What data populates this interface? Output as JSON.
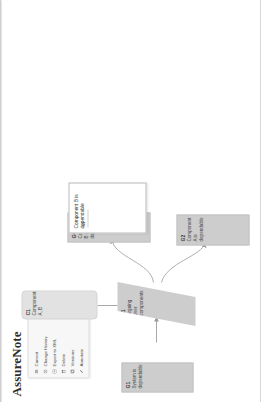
{
  "app": {
    "title": "AssureNote"
  },
  "context_menu": {
    "items": [
      {
        "label": "Current",
        "icon": "list-icon"
      },
      {
        "label": "Change History",
        "icon": "clock-icon"
      },
      {
        "label": "Export to XML",
        "icon": "export-icon"
      },
      {
        "label": "Delete",
        "icon": "trash-icon"
      },
      {
        "label": "Versions",
        "icon": "layers-icon"
      },
      {
        "label": "Annotate",
        "icon": "pencil-icon"
      }
    ]
  },
  "diagram": {
    "type": "gsn-assurance-case",
    "nodes": [
      {
        "id": "G1",
        "kind": "goal",
        "text": "System is dependable"
      },
      {
        "id": "S1",
        "kind": "strategy",
        "text": "Arguing over components"
      },
      {
        "id": "C1",
        "kind": "context",
        "text": "Components A, B"
      },
      {
        "id": "G2",
        "kind": "goal",
        "text": "Component A is dependable"
      },
      {
        "id": "G4",
        "kind": "goal",
        "text": "Component B is dependable"
      }
    ],
    "links": [
      {
        "from": "G1",
        "to": "S1",
        "style": "solid-arrow"
      },
      {
        "from": "C1",
        "to": "S1",
        "style": "plain-line"
      },
      {
        "from": "S1",
        "to": "G4",
        "style": "curved-arrow"
      },
      {
        "from": "S1",
        "to": "G2",
        "style": "curved-arrow"
      }
    ]
  },
  "popup": {
    "title": "Component B is dependable",
    "bullet": "• All"
  },
  "colors": {
    "node_fill": "#cfcfcf",
    "context_fill": "#e2e2e2",
    "popup_fill": "#ffffff",
    "link": "#a8a8a8",
    "text": "#3b3b3b",
    "panel": "#f7f7f7"
  }
}
